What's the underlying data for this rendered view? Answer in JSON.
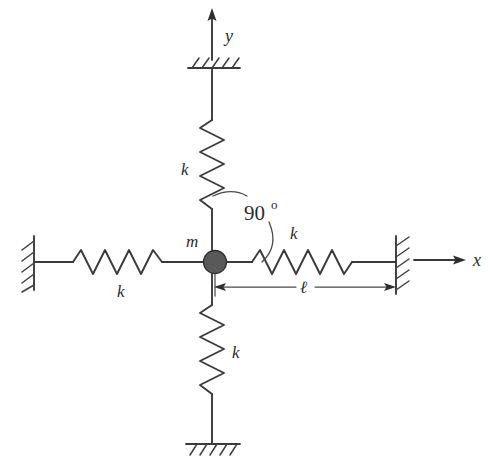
{
  "figure": {
    "type": "mechanics-free-body-diagram",
    "background_color": "#ffffff",
    "ink_color": "#3a3a3a",
    "mass_color": "#595959"
  },
  "axes": {
    "y_label": "y",
    "x_label": "x",
    "origin_note": "mass center"
  },
  "mass": {
    "label": "m"
  },
  "springs": [
    {
      "id": "spring-top",
      "label": "k",
      "orientation": "vertical",
      "anchor": "ceiling"
    },
    {
      "id": "spring-bottom",
      "label": "k",
      "orientation": "vertical",
      "anchor": "ground"
    },
    {
      "id": "spring-left",
      "label": "k",
      "orientation": "horizontal",
      "anchor": "left-wall"
    },
    {
      "id": "spring-right",
      "label": "k",
      "orientation": "horizontal",
      "anchor": "right-wall"
    }
  ],
  "annotations": {
    "angle_value": "90",
    "angle_unit": "o",
    "length_label": "ℓ"
  },
  "supports": [
    {
      "id": "ceiling-support",
      "kind": "hatched-fixed-support",
      "position": "top"
    },
    {
      "id": "ground-support",
      "kind": "hatched-fixed-support",
      "position": "bottom"
    },
    {
      "id": "left-wall-support",
      "kind": "hatched-fixed-support",
      "position": "left"
    },
    {
      "id": "right-wall-support",
      "kind": "hatched-fixed-support",
      "position": "right"
    }
  ]
}
